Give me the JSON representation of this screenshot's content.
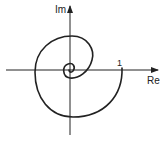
{
  "diagram": {
    "type": "complex-plane-spiral",
    "axes": {
      "x_label": "Re",
      "y_label": "Im"
    },
    "marks": {
      "real_tick_label": "1"
    },
    "colors": {
      "stroke": "#222222",
      "background": "#ffffff"
    }
  }
}
